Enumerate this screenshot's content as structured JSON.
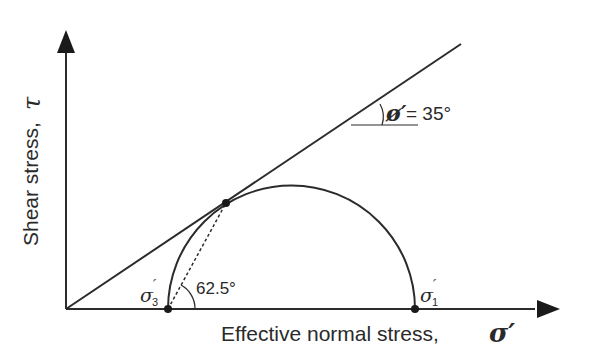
{
  "diagram": {
    "axes": {
      "x_label": "Effective normal stress,",
      "x_symbol": "σ′",
      "y_label": "Shear stress,",
      "y_symbol": "τ"
    },
    "envelope": {
      "angle_symbol": "ø′",
      "angle_text": "= 35°",
      "angle_value_deg": 35
    },
    "circle": {
      "sigma3_label": "σ",
      "sigma3_sub": "3",
      "sigma3_prime": "′",
      "sigma1_label": "σ",
      "sigma1_sub": "1",
      "sigma1_prime": "′"
    },
    "failure_plane": {
      "angle_text": "62.5°",
      "angle_value_deg": 62.5
    },
    "colors": {
      "line": "#2b2b2b",
      "background": "#ffffff"
    }
  }
}
